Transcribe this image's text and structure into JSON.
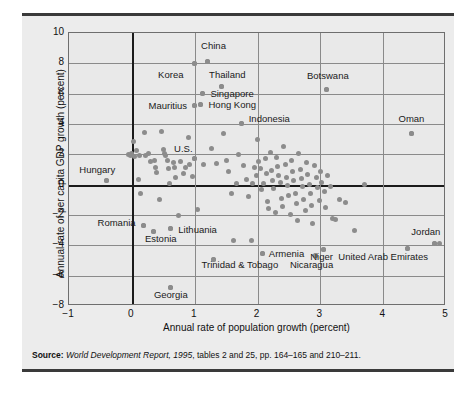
{
  "figure": {
    "background_color": "#ececec",
    "rule_color": "#3a3a3a",
    "dot_color": "#8c8c8c",
    "grid_color": "#8a8a8a",
    "axis_color": "#1b1b1b"
  },
  "source": {
    "label": "Source:",
    "italic_part": "World Development Report, 1995",
    "rest": ", tables 2 and 25, pp. 164–165 and 210–211."
  },
  "chart_data": {
    "type": "scatter",
    "title": "",
    "xlabel": "Annual rate of population growth (percent)",
    "ylabel": "Annual rate of per capita GDP growth (percent)",
    "xlim": [
      -1,
      5
    ],
    "ylim": [
      -8,
      10
    ],
    "xticks": [
      -1,
      0,
      1,
      2,
      3,
      4,
      5
    ],
    "yticks": [
      -8,
      -6,
      -4,
      -2,
      0,
      2,
      4,
      6,
      8,
      10
    ],
    "xtick_labels": [
      "−1",
      "0",
      "1",
      "2",
      "3",
      "4",
      "5"
    ],
    "ytick_labels": [
      "−8",
      "−6",
      "−4",
      "−2",
      "0",
      "2",
      "4",
      "6",
      "8",
      "10"
    ],
    "grid": true,
    "legend": "none",
    "emphasized_lines": {
      "y": 0,
      "x": 0
    },
    "annotations": [
      {
        "label": "China",
        "x": 1.2,
        "y": 8.1,
        "lx": 1.3,
        "ly": 9.15,
        "align": "center"
      },
      {
        "label": "Korea",
        "x": 1.0,
        "y": 8.0,
        "lx": 0.62,
        "ly": 7.2,
        "align": "center"
      },
      {
        "label": "Thailand",
        "x": 1.42,
        "y": 6.5,
        "lx": 1.52,
        "ly": 7.25,
        "align": "center"
      },
      {
        "label": "Botswana",
        "x": 3.1,
        "y": 6.3,
        "lx": 3.12,
        "ly": 7.15,
        "align": "center"
      },
      {
        "label": "Singapore",
        "x": 1.12,
        "y": 6.0,
        "lx": 1.25,
        "ly": 6.0,
        "align": "left"
      },
      {
        "label": "Hong Kong",
        "x": 1.1,
        "y": 5.3,
        "lx": 1.22,
        "ly": 5.25,
        "align": "left"
      },
      {
        "label": "Mauritius",
        "x": 1.0,
        "y": 5.2,
        "lx": 0.88,
        "ly": 5.2,
        "align": "right"
      },
      {
        "label": "Indonesia",
        "x": 1.74,
        "y": 4.05,
        "lx": 1.86,
        "ly": 4.35,
        "align": "left"
      },
      {
        "label": "Oman",
        "x": 4.45,
        "y": 3.4,
        "lx": 4.45,
        "ly": 4.3,
        "align": "center"
      },
      {
        "label": "U.S.",
        "x": 1.0,
        "y": 1.75,
        "lx": 0.82,
        "ly": 2.35,
        "align": "center"
      },
      {
        "label": "Hungary",
        "x": -0.4,
        "y": 0.25,
        "lx": -0.55,
        "ly": 0.95,
        "align": "center"
      },
      {
        "label": "Romania",
        "x": 0.18,
        "y": -2.7,
        "lx": 0.06,
        "ly": -2.55,
        "align": "right"
      },
      {
        "label": "Lithuania",
        "x": 0.62,
        "y": -2.9,
        "lx": 0.74,
        "ly": -3.0,
        "align": "left"
      },
      {
        "label": "Estonia",
        "x": 0.34,
        "y": -3.1,
        "lx": 0.46,
        "ly": -3.6,
        "align": "center"
      },
      {
        "label": "Jordan",
        "x": 4.82,
        "y": -3.85,
        "lx": 4.68,
        "ly": -3.15,
        "align": "center"
      },
      {
        "label": "Armenia",
        "x": 2.08,
        "y": -4.55,
        "lx": 2.18,
        "ly": -4.55,
        "align": "left"
      },
      {
        "label": "Niger",
        "x": 3.05,
        "y": -4.3,
        "lx": 3.02,
        "ly": -4.75,
        "align": "center"
      },
      {
        "label": "United Arab Emirates",
        "x": 4.38,
        "y": -4.2,
        "lx": 4.0,
        "ly": -4.8,
        "align": "center"
      },
      {
        "label": "Trinidad & Tobago",
        "x": 1.3,
        "y": -4.95,
        "lx": 1.72,
        "ly": -5.3,
        "align": "center"
      },
      {
        "label": "Nicaragua",
        "x": 2.92,
        "y": -4.7,
        "lx": 2.86,
        "ly": -5.3,
        "align": "center"
      },
      {
        "label": "Georgia",
        "x": 0.62,
        "y": -6.8,
        "lx": 0.62,
        "ly": -7.3,
        "align": "center"
      }
    ],
    "points": [
      [
        -0.4,
        0.25
      ],
      [
        -0.05,
        2.0
      ],
      [
        -0.02,
        1.9
      ],
      [
        0.0,
        2.05
      ],
      [
        0.02,
        2.85
      ],
      [
        0.05,
        1.85
      ],
      [
        0.08,
        2.25
      ],
      [
        0.1,
        0.35
      ],
      [
        0.12,
        1.95
      ],
      [
        0.14,
        -0.6
      ],
      [
        0.18,
        -2.7
      ],
      [
        0.2,
        3.45
      ],
      [
        0.22,
        1.9
      ],
      [
        0.26,
        2.05
      ],
      [
        0.3,
        1.55
      ],
      [
        0.34,
        -3.1
      ],
      [
        0.36,
        1.6
      ],
      [
        0.38,
        1.15
      ],
      [
        0.4,
        0.8
      ],
      [
        0.44,
        -0.95
      ],
      [
        0.48,
        3.5
      ],
      [
        0.5,
        2.3
      ],
      [
        0.52,
        2.05
      ],
      [
        0.54,
        1.95
      ],
      [
        0.56,
        1.6
      ],
      [
        0.58,
        1.05
      ],
      [
        0.6,
        0.05
      ],
      [
        0.62,
        -2.9
      ],
      [
        0.62,
        -6.8
      ],
      [
        0.66,
        1.45
      ],
      [
        0.68,
        1.1
      ],
      [
        0.7,
        0.45
      ],
      [
        0.74,
        -2.05
      ],
      [
        0.78,
        1.5
      ],
      [
        0.82,
        0.75
      ],
      [
        0.86,
        1.15
      ],
      [
        0.9,
        3.1
      ],
      [
        0.92,
        1.3
      ],
      [
        0.96,
        0.55
      ],
      [
        1.0,
        1.75
      ],
      [
        1.0,
        5.2
      ],
      [
        1.0,
        8.0
      ],
      [
        1.04,
        -1.65
      ],
      [
        1.1,
        5.3
      ],
      [
        1.12,
        6.0
      ],
      [
        1.14,
        1.35
      ],
      [
        1.2,
        8.1
      ],
      [
        1.26,
        2.4
      ],
      [
        1.3,
        -4.95
      ],
      [
        1.34,
        1.4
      ],
      [
        1.42,
        6.5
      ],
      [
        1.46,
        3.35
      ],
      [
        1.5,
        1.6
      ],
      [
        1.54,
        0.9
      ],
      [
        1.58,
        -0.55
      ],
      [
        1.62,
        -3.65
      ],
      [
        1.66,
        0.05
      ],
      [
        1.7,
        2.0
      ],
      [
        1.74,
        4.05
      ],
      [
        1.78,
        1.25
      ],
      [
        1.82,
        0.35
      ],
      [
        1.86,
        -0.75
      ],
      [
        1.9,
        -3.7
      ],
      [
        1.92,
        0.05
      ],
      [
        1.96,
        1.1
      ],
      [
        1.98,
        0.6
      ],
      [
        2.0,
        2.95
      ],
      [
        2.02,
        1.55
      ],
      [
        2.04,
        1.05
      ],
      [
        2.06,
        -0.35
      ],
      [
        2.08,
        -4.55
      ],
      [
        2.1,
        0.1
      ],
      [
        2.12,
        1.7
      ],
      [
        2.14,
        0.75
      ],
      [
        2.16,
        -1.1
      ],
      [
        2.18,
        -1.55
      ],
      [
        2.2,
        2.15
      ],
      [
        2.22,
        0.95
      ],
      [
        2.24,
        0.3
      ],
      [
        2.26,
        -0.25
      ],
      [
        2.28,
        -1.85
      ],
      [
        2.3,
        1.8
      ],
      [
        2.32,
        1.2
      ],
      [
        2.34,
        0.6
      ],
      [
        2.36,
        0.15
      ],
      [
        2.38,
        -0.9
      ],
      [
        2.4,
        -1.45
      ],
      [
        2.42,
        2.5
      ],
      [
        2.44,
        1.35
      ],
      [
        2.46,
        0.45
      ],
      [
        2.48,
        -0.05
      ],
      [
        2.5,
        -0.7
      ],
      [
        2.52,
        -1.95
      ],
      [
        2.54,
        1.6
      ],
      [
        2.56,
        0.85
      ],
      [
        2.58,
        0.25
      ],
      [
        2.6,
        -0.55
      ],
      [
        2.62,
        -1.25
      ],
      [
        2.64,
        -2.35
      ],
      [
        2.66,
        2.05
      ],
      [
        2.68,
        1.0
      ],
      [
        2.7,
        0.4
      ],
      [
        2.72,
        -0.15
      ],
      [
        2.74,
        -0.95
      ],
      [
        2.76,
        -1.7
      ],
      [
        2.78,
        1.45
      ],
      [
        2.8,
        0.7
      ],
      [
        2.82,
        0.0
      ],
      [
        2.84,
        -0.6
      ],
      [
        2.86,
        -1.35
      ],
      [
        2.88,
        -2.55
      ],
      [
        2.9,
        1.25
      ],
      [
        2.92,
        -4.7
      ],
      [
        2.94,
        0.5
      ],
      [
        2.96,
        -0.2
      ],
      [
        2.98,
        -1.05
      ],
      [
        3.0,
        0.85
      ],
      [
        3.02,
        0.15
      ],
      [
        3.05,
        -4.3
      ],
      [
        3.06,
        -0.45
      ],
      [
        3.08,
        -1.5
      ],
      [
        3.1,
        6.3
      ],
      [
        3.12,
        0.6
      ],
      [
        3.16,
        -0.1
      ],
      [
        3.2,
        -2.25
      ],
      [
        3.24,
        -2.3
      ],
      [
        3.3,
        -0.95
      ],
      [
        3.4,
        -1.15
      ],
      [
        3.55,
        -3.05
      ],
      [
        3.7,
        0.0
      ],
      [
        4.38,
        -4.2
      ],
      [
        4.45,
        3.4
      ],
      [
        4.82,
        -3.85
      ],
      [
        4.9,
        -3.9
      ]
    ]
  }
}
